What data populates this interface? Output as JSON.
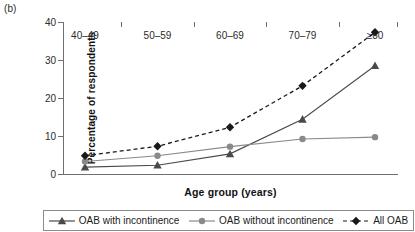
{
  "panel_label": "(b)",
  "chart_data": {
    "type": "line",
    "title": "",
    "xlabel": "Age group (years)",
    "ylabel": "Percentage of respondents",
    "categories": [
      "40–49",
      "50–59",
      "60–69",
      "70–79",
      "≥80"
    ],
    "ylim": [
      0,
      40
    ],
    "yticks": [
      0,
      10,
      20,
      30,
      40
    ],
    "ytick_labels": [
      "0",
      "10",
      "20",
      "30",
      "40"
    ],
    "grid": false,
    "legend_position": "below",
    "series": [
      {
        "name": "OAB with incontinence",
        "values": [
          1.8,
          2.3,
          5.3,
          14.4,
          28.5
        ],
        "marker": "triangle",
        "line_style": "solid",
        "color": "#4a4a4a"
      },
      {
        "name": "OAB without incontinence",
        "values": [
          3.3,
          4.8,
          7.2,
          9.2,
          9.7
        ],
        "marker": "circle",
        "line_style": "solid",
        "color": "#8a8a8a"
      },
      {
        "name": "All OAB",
        "values": [
          4.8,
          7.3,
          12.3,
          23.2,
          37.3
        ],
        "marker": "diamond",
        "line_style": "dashed",
        "color": "#1a1a1a"
      }
    ]
  },
  "legend": {
    "items": [
      {
        "label": "OAB with incontinence"
      },
      {
        "label": "OAB without incontinence"
      },
      {
        "label": "All OAB"
      }
    ]
  }
}
